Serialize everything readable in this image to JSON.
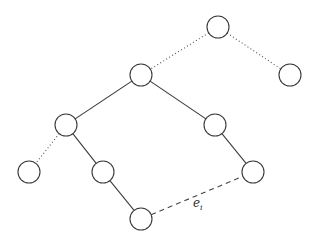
{
  "diagram": {
    "type": "tree",
    "node_radius": 11,
    "nodes": [
      {
        "id": "A",
        "x": 218,
        "y": 27
      },
      {
        "id": "B",
        "x": 141,
        "y": 75
      },
      {
        "id": "C",
        "x": 290,
        "y": 75
      },
      {
        "id": "D",
        "x": 66,
        "y": 125
      },
      {
        "id": "E",
        "x": 215,
        "y": 125
      },
      {
        "id": "F",
        "x": 29,
        "y": 172
      },
      {
        "id": "G",
        "x": 103,
        "y": 172
      },
      {
        "id": "H",
        "x": 253,
        "y": 172
      },
      {
        "id": "I",
        "x": 141,
        "y": 219
      }
    ],
    "edges": [
      {
        "from": "A",
        "to": "B",
        "style": "dotted"
      },
      {
        "from": "A",
        "to": "C",
        "style": "dotted"
      },
      {
        "from": "B",
        "to": "D",
        "style": "solid"
      },
      {
        "from": "B",
        "to": "E",
        "style": "solid"
      },
      {
        "from": "D",
        "to": "F",
        "style": "dotted"
      },
      {
        "from": "D",
        "to": "G",
        "style": "solid"
      },
      {
        "from": "E",
        "to": "H",
        "style": "solid"
      },
      {
        "from": "G",
        "to": "I",
        "style": "solid"
      },
      {
        "from": "I",
        "to": "H",
        "style": "dashed",
        "label": {
          "base": "e",
          "sub": "i",
          "x": 193,
          "y": 207
        }
      }
    ]
  }
}
